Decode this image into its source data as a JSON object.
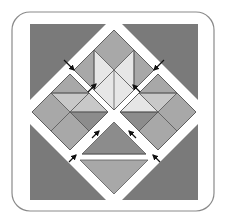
{
  "diagram": {
    "title": "",
    "type": "quilt-block-assembly",
    "colors": {
      "background": "#ffffff",
      "frame_stroke": "#8a8a8a",
      "corner_dark": "#7a7a7a",
      "mid_gray": "#a8a8a8",
      "light_gray": "#c8c8c8",
      "very_light": "#e6e6e6",
      "dark_gray": "#8c8c8c",
      "seam": "#5a5a5a",
      "arrow": "#111111",
      "sashing": "#ffffff"
    },
    "parts": [
      {
        "id": "corner-top-left",
        "label": "Corner triangle (top-left)"
      },
      {
        "id": "corner-top-right",
        "label": "Corner triangle (top-right)"
      },
      {
        "id": "corner-bottom-left",
        "label": "Corner triangle (bottom-left)"
      },
      {
        "id": "corner-bottom-right",
        "label": "Corner triangle (bottom-right)"
      },
      {
        "id": "unit-top",
        "label": "Top diamond unit"
      },
      {
        "id": "unit-left",
        "label": "Left diamond unit"
      },
      {
        "id": "unit-right",
        "label": "Right diamond unit"
      },
      {
        "id": "unit-bottom",
        "label": "Bottom triangle unit"
      }
    ],
    "arrows": [
      {
        "id": "arrow-1",
        "direction": "down-right"
      },
      {
        "id": "arrow-2",
        "direction": "up-right"
      },
      {
        "id": "arrow-3",
        "direction": "down-left"
      },
      {
        "id": "arrow-4",
        "direction": "up-left"
      },
      {
        "id": "arrow-5",
        "direction": "up-right"
      },
      {
        "id": "arrow-6",
        "direction": "up-left"
      },
      {
        "id": "arrow-7",
        "direction": "up-right"
      },
      {
        "id": "arrow-8",
        "direction": "up-left"
      }
    ]
  }
}
